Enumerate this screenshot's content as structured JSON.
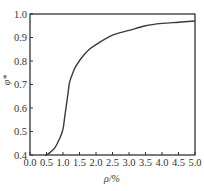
{
  "chart_data": {
    "type": "line",
    "title": "",
    "xlabel": "ρ/%",
    "ylabel": "φ*",
    "xlim": [
      0.0,
      5.0
    ],
    "ylim": [
      0.4,
      1.0
    ],
    "grid": false,
    "legend": null,
    "x_ticks": [
      "0.0",
      "0.5",
      "1.0",
      "1.5",
      "2.0",
      "2.5",
      "3.0",
      "3.5",
      "4.0",
      "4.5",
      "5.0"
    ],
    "y_ticks": [
      "0.4",
      "0.5",
      "0.6",
      "0.7",
      "0.8",
      "0.9",
      "1.0"
    ],
    "series": [
      {
        "name": "φ*",
        "x": [
          0.45,
          0.5,
          0.6,
          0.75,
          0.9,
          1.0,
          1.05,
          1.1,
          1.15,
          1.2,
          1.3,
          1.4,
          1.6,
          1.8,
          2.0,
          2.5,
          3.0,
          3.5,
          4.0,
          4.5,
          5.0
        ],
        "y": [
          0.4,
          0.4,
          0.41,
          0.43,
          0.47,
          0.51,
          0.56,
          0.61,
          0.66,
          0.71,
          0.75,
          0.78,
          0.82,
          0.85,
          0.87,
          0.91,
          0.93,
          0.95,
          0.96,
          0.965,
          0.97
        ]
      }
    ]
  }
}
